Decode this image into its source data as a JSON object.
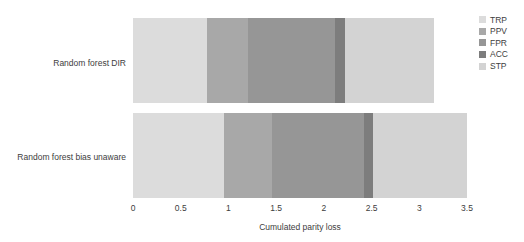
{
  "chart_data": {
    "type": "bar",
    "orientation": "horizontal",
    "stacked": true,
    "title": "",
    "subtitle": "",
    "xlabel": "Cumulated parity loss",
    "ylabel": "",
    "xlim": [
      0,
      3.5
    ],
    "xticks": [
      "0",
      "0.5",
      "1",
      "1.5",
      "2",
      "2.5",
      "3",
      "3.5"
    ],
    "xtick_values": [
      0,
      0.5,
      1,
      1.5,
      2,
      2.5,
      3,
      3.5
    ],
    "grid": false,
    "legend_position": "right",
    "categories": [
      "Random forest DIR",
      "Random forest bias unaware"
    ],
    "series": [
      {
        "name": "TRP",
        "color": "#dcdcdc",
        "values": [
          0.78,
          0.95
        ]
      },
      {
        "name": "PPV",
        "color": "#a8a8a8",
        "values": [
          0.42,
          0.51
        ]
      },
      {
        "name": "FPR",
        "color": "#969696",
        "values": [
          0.92,
          0.96
        ]
      },
      {
        "name": "ACC",
        "color": "#7d7d7d",
        "values": [
          0.1,
          0.1
        ]
      },
      {
        "name": "STP",
        "color": "#d3d3d3",
        "values": [
          0.93,
          0.98
        ]
      }
    ],
    "totals": [
      3.15,
      3.5
    ],
    "segment_boundaries": {
      "Random forest DIR": [
        0,
        0.78,
        1.2,
        2.12,
        2.22,
        3.15
      ],
      "Random forest bias unaware": [
        0,
        0.95,
        1.46,
        2.42,
        2.52,
        3.5
      ]
    }
  },
  "legend": {
    "items": [
      {
        "label": "TRP",
        "color": "#dcdcdc"
      },
      {
        "label": "PPV",
        "color": "#a8a8a8"
      },
      {
        "label": "FPR",
        "color": "#969696"
      },
      {
        "label": "ACC",
        "color": "#7d7d7d"
      },
      {
        "label": "STP",
        "color": "#d3d3d3"
      }
    ]
  }
}
